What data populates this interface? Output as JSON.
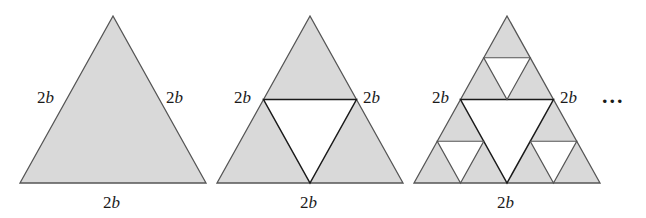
{
  "figure": {
    "fill_color": "#d9d9d9",
    "hole_color": "#ffffff",
    "stroke_color": "#555555",
    "inner_stroke_color": "#1a1a1a",
    "continuation": "...",
    "stages": [
      {
        "name": "stage-0",
        "labels": {
          "left": {
            "num": "2",
            "var": "b"
          },
          "right": {
            "num": "2",
            "var": "b"
          },
          "bottom": {
            "num": "2",
            "var": "b"
          }
        }
      },
      {
        "name": "stage-1",
        "labels": {
          "left": {
            "num": "2",
            "var": "b"
          },
          "right": {
            "num": "2",
            "var": "b"
          },
          "bottom": {
            "num": "2",
            "var": "b"
          }
        }
      },
      {
        "name": "stage-2",
        "labels": {
          "left": {
            "num": "2",
            "var": "b"
          },
          "right": {
            "num": "2",
            "var": "b"
          },
          "bottom": {
            "num": "2",
            "var": "b"
          }
        }
      }
    ]
  }
}
